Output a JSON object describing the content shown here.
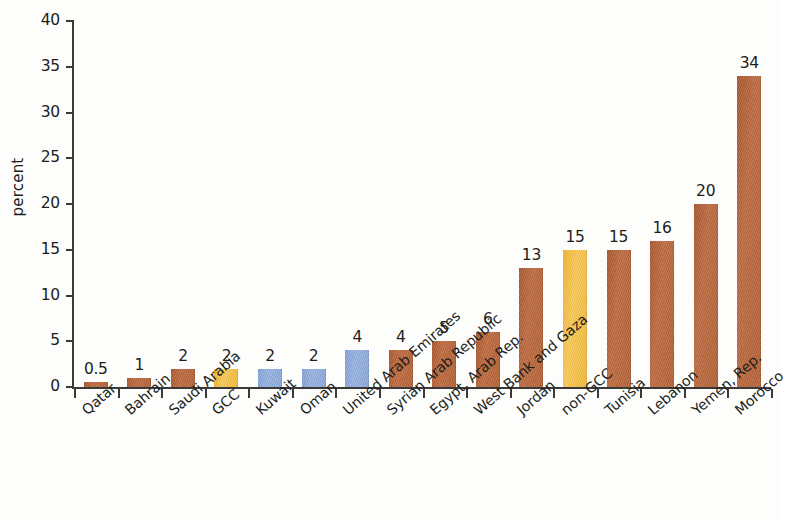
{
  "chart_data": {
    "type": "bar",
    "title": "",
    "subtitle": "",
    "xlabel": "",
    "ylabel": "percent",
    "ylim": [
      0,
      40
    ],
    "ytick_step": 5,
    "grid": false,
    "legend": "none",
    "categories": [
      "Qatar",
      "Bahrain",
      "Saudi Arabia",
      "GCC",
      "Kuwait",
      "Oman",
      "United Arab Emirates",
      "Syrian Arab Republic",
      "Egypt, Arab Rep.",
      "West Bank and Gaza",
      "Jordan",
      "non-GCC",
      "Tunisia",
      "Lebanon",
      "Yemen, Rep.",
      "Morocco"
    ],
    "values": [
      0.5,
      1,
      2,
      2,
      2,
      2,
      4,
      4,
      5,
      6,
      13,
      15,
      15,
      16,
      20,
      34
    ],
    "value_labels": [
      "0.5",
      "1",
      "2",
      "2",
      "2",
      "2",
      "4",
      "4",
      "5",
      "6",
      "13",
      "15",
      "15",
      "16",
      "20",
      "34"
    ],
    "bar_colors": [
      "brown",
      "brown",
      "brown",
      "amber",
      "blue",
      "blue",
      "blue",
      "brown",
      "brown",
      "brown",
      "brown",
      "amber",
      "brown",
      "brown",
      "brown",
      "brown"
    ],
    "ytick_labels": [
      "0",
      "5",
      "10",
      "15",
      "20",
      "25",
      "30",
      "35",
      "40"
    ],
    "ytick_values": [
      0,
      5,
      10,
      15,
      20,
      25,
      30,
      35,
      40
    ],
    "colors": {
      "brown": "#b4632f",
      "amber": "#f3bc3d",
      "blue": "#8aa8da",
      "axis": "#3c3a38",
      "text": "#201e1c",
      "background": "#fdfdfb"
    }
  }
}
